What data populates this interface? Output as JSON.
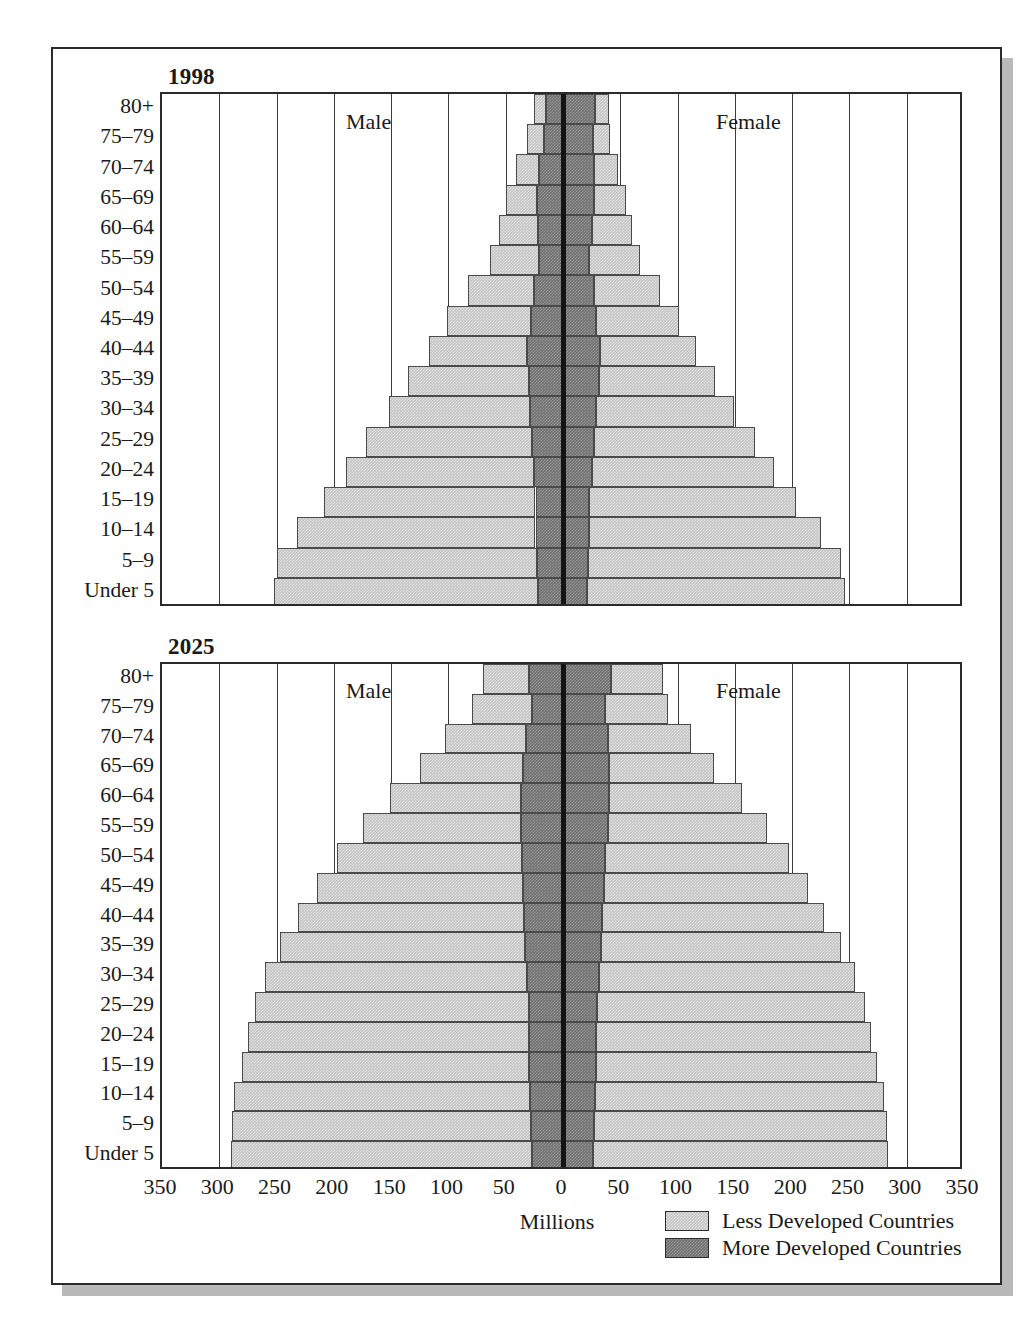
{
  "figure": {
    "age_groups": [
      "80+",
      "75–79",
      "70–74",
      "65–69",
      "60–64",
      "55–59",
      "50–54",
      "45–49",
      "40–44",
      "35–39",
      "30–34",
      "25–29",
      "20–24",
      "15–19",
      "10–14",
      "5–9",
      "Under 5"
    ],
    "male_label": "Male",
    "female_label": "Female",
    "x_axis_title": "Millions",
    "x_ticks": [
      "350",
      "300",
      "250",
      "200",
      "150",
      "100",
      "50",
      "0",
      "50",
      "100",
      "150",
      "200",
      "250",
      "300",
      "350"
    ],
    "legend": [
      {
        "label": "Less Developed Countries",
        "color": "#c4c4c4",
        "key": "less"
      },
      {
        "label": "More Developed Countries",
        "color": "#717171",
        "key": "more"
      }
    ],
    "colors": {
      "less_developed": "#c4c4c4",
      "more_developed": "#717171",
      "frame": "#2b2b2b",
      "gridline": "#3a3a3a",
      "centerline": "#141414",
      "background": "#ffffff",
      "shadow": "#b9b9b9"
    }
  },
  "chart_data": [
    {
      "type": "bar",
      "title": "1998",
      "subtitle": "",
      "xlabel": "Millions",
      "ylabel": "",
      "orientation": "horizontal-pyramid",
      "xlim": [
        -350,
        350
      ],
      "x_ticks": [
        -350,
        -300,
        -250,
        -200,
        -150,
        -100,
        -50,
        0,
        50,
        100,
        150,
        200,
        250,
        300,
        350
      ],
      "x_tick_labels": [
        "350",
        "300",
        "250",
        "200",
        "150",
        "100",
        "50",
        "0",
        "50",
        "100",
        "150",
        "200",
        "250",
        "300",
        "350"
      ],
      "grid": true,
      "legend_position": "bottom-right",
      "categories": [
        "80+",
        "75–79",
        "70–74",
        "65–69",
        "60–64",
        "55–59",
        "50–54",
        "45–49",
        "40–44",
        "35–39",
        "30–34",
        "25–29",
        "20–24",
        "15–19",
        "10–14",
        "5–9",
        "Under 5"
      ],
      "series": [
        {
          "name": "Male – More Developed Countries",
          "side": "left",
          "stack": "more",
          "values": [
            15,
            17,
            21,
            23,
            22,
            21,
            25,
            28,
            31,
            30,
            29,
            27,
            25,
            24,
            24,
            23,
            22
          ]
        },
        {
          "name": "Male – Less Developed Countries",
          "side": "left",
          "stack": "less",
          "values": [
            10,
            14,
            20,
            27,
            34,
            43,
            58,
            73,
            86,
            105,
            123,
            145,
            164,
            185,
            208,
            227,
            230
          ]
        },
        {
          "name": "Female – More Developed Countries",
          "side": "right",
          "stack": "more",
          "values": [
            28,
            26,
            27,
            27,
            25,
            23,
            27,
            29,
            32,
            31,
            29,
            27,
            25,
            23,
            23,
            22,
            21
          ]
        },
        {
          "name": "Female – Less Developed Countries",
          "side": "right",
          "stack": "less",
          "values": [
            12,
            15,
            21,
            28,
            35,
            44,
            58,
            72,
            84,
            102,
            120,
            141,
            159,
            180,
            202,
            221,
            225
          ]
        }
      ]
    },
    {
      "type": "bar",
      "title": "2025",
      "subtitle": "",
      "xlabel": "Millions",
      "ylabel": "",
      "orientation": "horizontal-pyramid",
      "xlim": [
        -350,
        350
      ],
      "x_ticks": [
        -350,
        -300,
        -250,
        -200,
        -150,
        -100,
        -50,
        0,
        50,
        100,
        150,
        200,
        250,
        300,
        350
      ],
      "x_tick_labels": [
        "350",
        "300",
        "250",
        "200",
        "150",
        "100",
        "50",
        "0",
        "50",
        "100",
        "150",
        "200",
        "250",
        "300",
        "350"
      ],
      "grid": true,
      "legend_position": "bottom-right",
      "categories": [
        "80+",
        "75–79",
        "70–74",
        "65–69",
        "60–64",
        "55–59",
        "50–54",
        "45–49",
        "40–44",
        "35–39",
        "30–34",
        "25–29",
        "20–24",
        "15–19",
        "10–14",
        "5–9",
        "Under 5"
      ],
      "series": [
        {
          "name": "Male – More Developed Countries",
          "side": "left",
          "stack": "more",
          "values": [
            30,
            27,
            32,
            35,
            37,
            37,
            36,
            35,
            34,
            33,
            31,
            30,
            30,
            30,
            29,
            28,
            27
          ]
        },
        {
          "name": "Male – Less Developed Countries",
          "side": "left",
          "stack": "less",
          "values": [
            40,
            52,
            71,
            90,
            114,
            138,
            161,
            180,
            197,
            214,
            229,
            239,
            245,
            250,
            258,
            261,
            263
          ]
        },
        {
          "name": "Female – More Developed Countries",
          "side": "right",
          "stack": "more",
          "values": [
            42,
            37,
            39,
            40,
            40,
            39,
            37,
            36,
            34,
            33,
            31,
            30,
            29,
            29,
            28,
            27,
            26
          ]
        },
        {
          "name": "Female – Less Developed Countries",
          "side": "right",
          "stack": "less",
          "values": [
            45,
            55,
            73,
            92,
            116,
            139,
            160,
            178,
            194,
            210,
            224,
            234,
            240,
            245,
            252,
            256,
            258
          ]
        }
      ]
    }
  ]
}
